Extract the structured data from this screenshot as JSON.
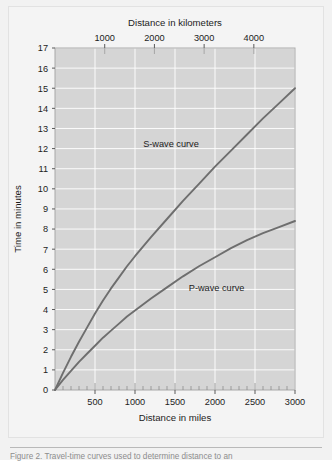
{
  "figure": {
    "caption": "Figure 2.  Travel-time curves used to determine distance to an"
  },
  "chart_data": {
    "type": "line",
    "title": "",
    "subtitle": "",
    "plot_background": "#d5d5d5",
    "grid": "on",
    "grid_color": "#ffffff",
    "curve_color": "#6e6e6e",
    "legend_position": "inline-annotations",
    "xlabel": "Distance in miles",
    "xlabel_top": "Distance in kilometers",
    "ylabel": "Time in minutes",
    "xlim": [
      0,
      3000
    ],
    "xlim_top_km": [
      0,
      4828
    ],
    "ylim": [
      0,
      17
    ],
    "x_ticks": [
      0,
      500,
      1000,
      1500,
      2000,
      2500,
      3000
    ],
    "x_tick_labels": [
      "",
      "500",
      "1000",
      "1500",
      "2000",
      "2500",
      "3000"
    ],
    "x_minor_tick_step": 100,
    "x_top_ticks_km": [
      1000,
      2000,
      3000,
      4000
    ],
    "x_top_tick_labels": [
      "1000",
      "2000",
      "3000",
      "4000"
    ],
    "y_ticks": [
      0,
      1,
      2,
      3,
      4,
      5,
      6,
      7,
      8,
      9,
      10,
      11,
      12,
      13,
      14,
      15,
      16,
      17
    ],
    "y_tick_labels": [
      "0",
      "1",
      "2",
      "3",
      "4",
      "5",
      "6",
      "7",
      "8",
      "9",
      "10",
      "11",
      "12",
      "13",
      "14",
      "15",
      "16",
      "17"
    ],
    "annotations": [
      {
        "text": "S-wave curve",
        "x_miles": 1450,
        "y_minutes": 12.1
      },
      {
        "text": "P-wave curve",
        "x_miles": 2020,
        "y_minutes": 4.9
      }
    ],
    "series": [
      {
        "name": "S-wave curve",
        "x": [
          0,
          100,
          200,
          300,
          400,
          500,
          600,
          700,
          800,
          900,
          1000,
          1200,
          1400,
          1600,
          1800,
          2000,
          2200,
          2400,
          2600,
          2800,
          3000
        ],
        "values": [
          0.0,
          0.85,
          1.65,
          2.4,
          3.1,
          3.8,
          4.45,
          5.05,
          5.6,
          6.15,
          6.65,
          7.6,
          8.5,
          9.4,
          10.25,
          11.1,
          11.9,
          12.7,
          13.5,
          14.25,
          15.0
        ]
      },
      {
        "name": "P-wave curve",
        "x": [
          0,
          100,
          200,
          300,
          400,
          500,
          600,
          700,
          800,
          900,
          1000,
          1200,
          1400,
          1600,
          1800,
          2000,
          2200,
          2400,
          2600,
          2800,
          3000
        ],
        "values": [
          0.0,
          0.5,
          0.95,
          1.4,
          1.8,
          2.2,
          2.6,
          2.95,
          3.3,
          3.65,
          3.95,
          4.55,
          5.1,
          5.65,
          6.15,
          6.6,
          7.05,
          7.45,
          7.8,
          8.1,
          8.4
        ]
      }
    ]
  }
}
